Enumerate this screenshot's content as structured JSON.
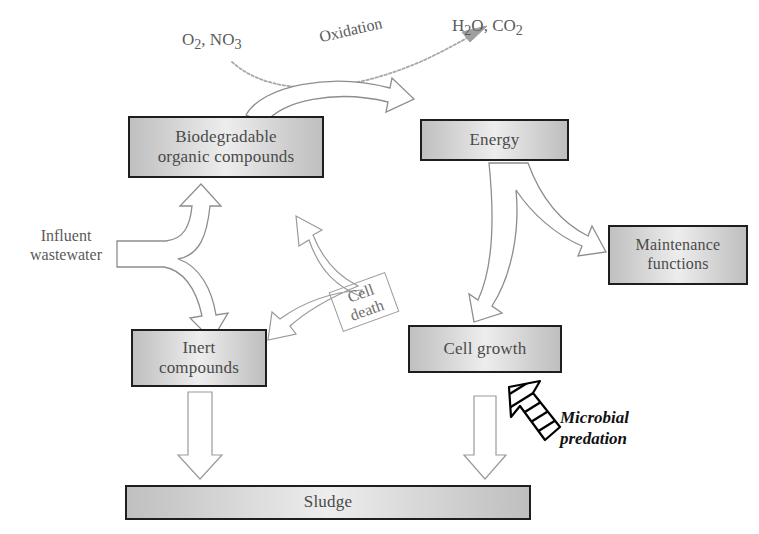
{
  "diagram": {
    "boxes": {
      "biodegradable": {
        "line1": "Biodegradable",
        "line2": "organic compounds"
      },
      "energy": {
        "label": "Energy"
      },
      "maintenance": {
        "line1": "Maintenance",
        "line2": "functions"
      },
      "inert": {
        "line1": "Inert",
        "line2": "compounds"
      },
      "cell_growth": {
        "label": "Cell growth"
      },
      "sludge": {
        "label": "Sludge"
      }
    },
    "labels": {
      "reactants": "O2, NO3",
      "reactants_parts": {
        "o": "O",
        "o_sub": "2",
        "sep": ", NO",
        "n_sub": "3"
      },
      "oxidation": "Oxidation",
      "products": "H2O, CO2",
      "products_parts": {
        "h": "H",
        "h_sub": "2",
        "mid": "O, CO",
        "c_sub": "2"
      },
      "influent": {
        "line1": "Influent",
        "line2": "wastewater"
      },
      "cell_death": {
        "line1": "Cell",
        "line2": "death"
      },
      "predation": {
        "line1": "Microbial",
        "line2": "predation"
      }
    },
    "caption": "",
    "colors": {
      "box_fill_light": "#ededed",
      "box_fill_dark": "#c0c0c0",
      "box_border": "#1e1e1e",
      "box_text": "#4a4a4a",
      "label_text": "#5a5a5a",
      "arrow_outline": "#8d8d8d",
      "predation_arrow": "#111111",
      "background": "#ffffff"
    },
    "flows": [
      {
        "from": "O2, NO3",
        "to": "H2O, CO2",
        "label": "Oxidation",
        "style": "curved-dashed"
      },
      {
        "from": "Biodegradable organic compounds",
        "to": "Energy",
        "label": "",
        "style": "arc-block"
      },
      {
        "from": "Influent wastewater",
        "to": "Biodegradable organic compounds",
        "label": "",
        "style": "fork-block"
      },
      {
        "from": "Influent wastewater",
        "to": "Inert compounds",
        "label": "",
        "style": "fork-block"
      },
      {
        "from": "Energy",
        "to": "Maintenance functions",
        "label": "",
        "style": "fork-block"
      },
      {
        "from": "Energy",
        "to": "Cell growth",
        "label": "",
        "style": "fork-block"
      },
      {
        "from": "Cell growth",
        "to": "Biodegradable organic compounds",
        "label": "Cell death",
        "style": "fork-block"
      },
      {
        "from": "Cell growth",
        "to": "Inert compounds",
        "label": "Cell death",
        "style": "fork-block"
      },
      {
        "from": "Inert compounds",
        "to": "Sludge",
        "label": "",
        "style": "straight-hollow"
      },
      {
        "from": "Cell growth",
        "to": "Sludge",
        "label": "",
        "style": "straight-hollow"
      },
      {
        "from": "Microbial predation",
        "to": "Cell growth",
        "label": "Microbial predation",
        "style": "striped-solid"
      }
    ]
  }
}
